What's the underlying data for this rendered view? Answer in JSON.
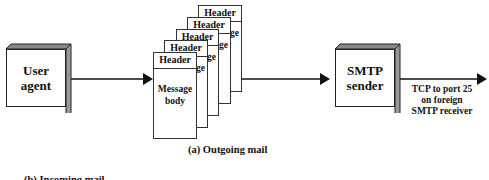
{
  "diagram": {
    "title": "(a) Outgoing mail",
    "nodes": {
      "user_agent": {
        "label_line1": "User",
        "label_line2": "agent"
      },
      "smtp_sender": {
        "label_line1": "SMTP",
        "label_line2": "sender"
      }
    },
    "queue": {
      "pages": [
        {
          "header": "Header",
          "edge_text": "ge"
        },
        {
          "header": "Header",
          "edge_text": "ge"
        },
        {
          "header": "Header",
          "edge_text": "ge"
        },
        {
          "header": "Header",
          "edge_text": "ge"
        },
        {
          "header": "Header",
          "body_line1": "Message",
          "body_line2": "body"
        }
      ]
    },
    "edges": {
      "output_label_line1": "TCP to port 25",
      "output_label_line2": "on foreign",
      "output_label_line3": "SMTP receiver"
    },
    "bottom_partial_text": "(b) Incoming mail"
  }
}
